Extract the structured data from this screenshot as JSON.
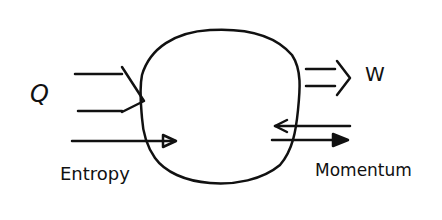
{
  "diagram": {
    "system": {
      "shape": "irregular-blob",
      "stroke": "#111111"
    },
    "labels": {
      "heat": "Q",
      "work": "W",
      "entropy": "Entropy",
      "momentum": "Momentum"
    },
    "flows": [
      {
        "name": "heat",
        "direction": "in",
        "style": "double-line-arrow"
      },
      {
        "name": "work",
        "direction": "out",
        "style": "double-line-arrow"
      },
      {
        "name": "entropy",
        "direction": "in",
        "style": "single-arrow"
      },
      {
        "name": "momentum",
        "direction": "in-and-out",
        "style": "two-opposing-arrows"
      }
    ]
  }
}
